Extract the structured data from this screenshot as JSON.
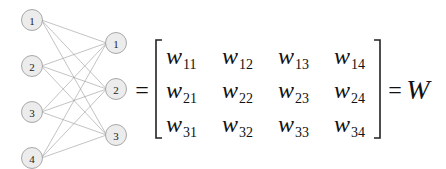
{
  "diagram": {
    "type": "neural-network-weight-matrix",
    "input_layer": {
      "nodes": [
        "1",
        "2",
        "3",
        "4"
      ]
    },
    "output_layer": {
      "nodes": [
        "1",
        "2",
        "3"
      ]
    },
    "connections": "fully-connected",
    "colors": {
      "node_fill": "#ececec",
      "node_stroke": "#a8a8a8",
      "edge": "#9a9a9a",
      "text": "#111111"
    }
  },
  "equation": {
    "equals_left": "=",
    "matrix": {
      "rows": [
        [
          {
            "base": "w",
            "sub": "11"
          },
          {
            "base": "w",
            "sub": "12"
          },
          {
            "base": "w",
            "sub": "13"
          },
          {
            "base": "w",
            "sub": "14"
          }
        ],
        [
          {
            "base": "w",
            "sub": "21"
          },
          {
            "base": "w",
            "sub": "22"
          },
          {
            "base": "w",
            "sub": "23"
          },
          {
            "base": "w",
            "sub": "24"
          }
        ],
        [
          {
            "base": "w",
            "sub": "31"
          },
          {
            "base": "w",
            "sub": "32"
          },
          {
            "base": "w",
            "sub": "33"
          },
          {
            "base": "w",
            "sub": "34"
          }
        ]
      ]
    },
    "equals_right": "=",
    "result": "W"
  }
}
